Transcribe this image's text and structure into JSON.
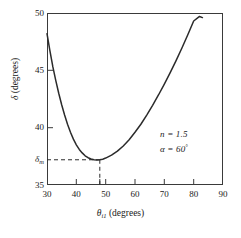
{
  "chart_data": {
    "type": "line",
    "title": "",
    "xlabel": "θi1 (degrees)",
    "ylabel": "δ (degrees)",
    "xlim": [
      30,
      90
    ],
    "ylim": [
      35,
      50
    ],
    "grid": false,
    "legend": "none",
    "x_ticks": [
      30,
      40,
      50,
      60,
      70,
      80,
      90
    ],
    "x_tick_labels": [
      "30",
      "40",
      "50",
      "60",
      "70",
      "80",
      "90"
    ],
    "x_minor_ticks": [
      48,
      50
    ],
    "y_ticks": [
      35,
      40,
      45,
      50
    ],
    "y_tick_labels": [
      "35",
      "40",
      "45",
      "50"
    ],
    "y_special_tick": {
      "value": 37.2,
      "label": "δm"
    },
    "series": [
      {
        "name": "deviation",
        "x": [
          30.0,
          31.0,
          32.0,
          33.0,
          34.0,
          35.0,
          36.0,
          37.0,
          38.0,
          39.0,
          40.0,
          41.0,
          42.0,
          43.0,
          44.0,
          45.0,
          46.0,
          47.0,
          48.0,
          49.0,
          50.0,
          52.0,
          54.0,
          56.0,
          58.0,
          60.0,
          62.0,
          64.0,
          66.0,
          68.0,
          70.0,
          72.0,
          74.0,
          76.0,
          78.0,
          80.0,
          82.0,
          83.0
        ],
        "y": [
          48.2,
          46.7,
          45.3,
          44.1,
          43.0,
          42.0,
          41.1,
          40.3,
          39.6,
          39.0,
          38.5,
          38.1,
          37.8,
          37.55,
          37.38,
          37.27,
          37.21,
          37.19,
          37.2,
          37.25,
          37.35,
          37.6,
          37.95,
          38.4,
          38.95,
          39.6,
          40.3,
          41.1,
          41.95,
          42.85,
          43.8,
          44.8,
          45.85,
          46.95,
          48.1,
          49.3,
          49.7,
          49.6
        ]
      }
    ],
    "annotations": [
      {
        "id": "minimum-marker",
        "type": "dashed-guides",
        "x": 48,
        "y": 37.2
      },
      {
        "id": "params",
        "lines": [
          "n = 1.5",
          "α = 60°"
        ]
      }
    ]
  },
  "axes": {
    "y": {
      "label_prefix": "δ",
      "label_suffix": " (degrees)",
      "ticks": [
        {
          "label": "50",
          "value": 50
        },
        {
          "label": "45",
          "value": 45
        },
        {
          "label": "40",
          "value": 40
        },
        {
          "label": "35",
          "value": 35
        }
      ],
      "min_tick": {
        "symbol": "δ",
        "subscript": "m"
      }
    },
    "x": {
      "label_symbol": "θ",
      "label_subscript": "i1",
      "label_suffix": " (degrees)",
      "ticks": [
        {
          "label": "30",
          "value": 30
        },
        {
          "label": "40",
          "value": 40
        },
        {
          "label": "50",
          "value": 50
        },
        {
          "label": "60",
          "value": 60
        },
        {
          "label": "70",
          "value": 70
        },
        {
          "label": "80",
          "value": 80
        },
        {
          "label": "90",
          "value": 90
        }
      ]
    }
  },
  "annotation": {
    "refractive_index": "n = 1.5",
    "apex_symbol": "α = 60",
    "apex_degree": "°"
  },
  "caption": {
    "text": ""
  },
  "colors": {
    "curve": "#2b2b2b",
    "frame": "#3a3a3a",
    "text": "#1a1a1a",
    "dashed": "#2b2b2b",
    "background": "#ffffff"
  }
}
